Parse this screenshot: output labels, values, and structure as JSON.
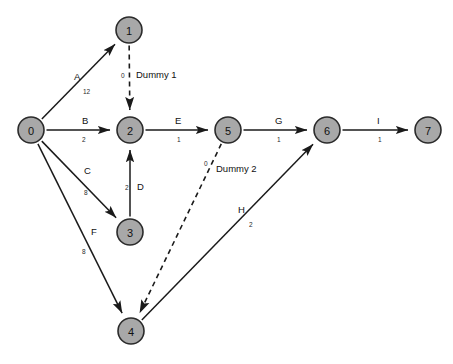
{
  "diagram": {
    "type": "activity-on-arrow-network",
    "background_color": "#ffffff",
    "node_fill_color": "#a8a8a8",
    "node_stroke_color": "#2b2b2b",
    "edge_color": "#1a1a1a",
    "nodes": [
      {
        "id": "0",
        "label": "0",
        "cx": 31,
        "cy": 130
      },
      {
        "id": "1",
        "label": "1",
        "cx": 129,
        "cy": 30
      },
      {
        "id": "2",
        "label": "2",
        "cx": 130,
        "cy": 130
      },
      {
        "id": "3",
        "label": "3",
        "cx": 130,
        "cy": 232
      },
      {
        "id": "4",
        "label": "4",
        "cx": 131,
        "cy": 331
      },
      {
        "id": "5",
        "label": "5",
        "cx": 228,
        "cy": 130
      },
      {
        "id": "6",
        "label": "6",
        "cx": 327,
        "cy": 130
      },
      {
        "id": "7",
        "label": "7",
        "cx": 428,
        "cy": 130
      }
    ],
    "edges": [
      {
        "name": "A",
        "weight": "12",
        "from": "0",
        "to": "1",
        "style": "solid",
        "name_x": 74,
        "name_y": 80,
        "weight_x": 83,
        "weight_y": 94
      },
      {
        "name": "B",
        "weight": "2",
        "from": "0",
        "to": "2",
        "style": "solid",
        "name_x": 82,
        "name_y": 124,
        "weight_x": 82,
        "weight_y": 142
      },
      {
        "name": "C",
        "weight": "8",
        "from": "0",
        "to": "3",
        "style": "solid",
        "name_x": 84,
        "name_y": 174,
        "weight_x": 84,
        "weight_y": 195
      },
      {
        "name": "D",
        "weight": "2",
        "from": "3",
        "to": "2",
        "style": "solid",
        "name_x": 137,
        "name_y": 190,
        "weight_x": 125,
        "weight_y": 190
      },
      {
        "name": "E",
        "weight": "1",
        "from": "2",
        "to": "5",
        "style": "solid",
        "name_x": 175,
        "name_y": 124,
        "weight_x": 177,
        "weight_y": 142
      },
      {
        "name": "F",
        "weight": "8",
        "from": "0",
        "to": "4",
        "style": "solid",
        "name_x": 91,
        "name_y": 235,
        "weight_x": 82,
        "weight_y": 254
      },
      {
        "name": "G",
        "weight": "1",
        "from": "5",
        "to": "6",
        "style": "solid",
        "name_x": 275,
        "name_y": 124,
        "weight_x": 277,
        "weight_y": 142
      },
      {
        "name": "H",
        "weight": "2",
        "from": "4",
        "to": "6",
        "style": "solid",
        "name_x": 238,
        "name_y": 213,
        "weight_x": 249,
        "weight_y": 227
      },
      {
        "name": "I",
        "weight": "1",
        "from": "6",
        "to": "7",
        "style": "solid",
        "name_x": 377,
        "name_y": 124,
        "weight_x": 378,
        "weight_y": 142
      },
      {
        "name": "Dummy 1",
        "weight": "0",
        "from": "1",
        "to": "2",
        "style": "dashed",
        "name_x": 136,
        "name_y": 78,
        "weight_x": 121,
        "weight_y": 78
      },
      {
        "name": "Dummy 2",
        "weight": "0",
        "from": "5",
        "to": "4",
        "style": "dashed",
        "name_x": 216,
        "name_y": 172,
        "weight_x": 204,
        "weight_y": 166
      }
    ]
  }
}
